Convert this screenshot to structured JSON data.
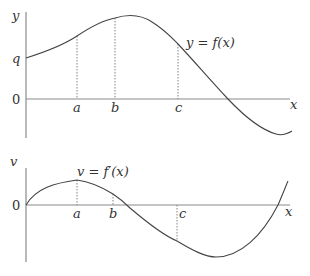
{
  "top_graph": {
    "y_axis_label": "y",
    "x_axis_label": "x",
    "origin_label": "0",
    "intercept_label": "q",
    "curve_label": "y = f(x)",
    "tick_labels": [
      "a",
      "b",
      "c"
    ]
  },
  "bottom_graph": {
    "y_axis_label": "v",
    "x_axis_label": "x",
    "origin_label": "0",
    "curve_label": "v = f′(x)",
    "tick_labels": [
      "a",
      "b",
      "c"
    ]
  }
}
